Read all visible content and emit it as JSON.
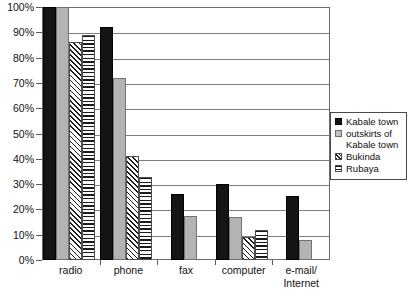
{
  "chart_data": {
    "type": "bar",
    "title": "",
    "xlabel": "",
    "ylabel": "",
    "ylim": [
      0,
      100
    ],
    "ytick_labels": [
      "0%",
      "10%",
      "20%",
      "30%",
      "40%",
      "50%",
      "60%",
      "70%",
      "80%",
      "90%",
      "100%"
    ],
    "ytick_values": [
      0,
      10,
      20,
      30,
      40,
      50,
      60,
      70,
      80,
      90,
      100
    ],
    "grid": true,
    "legend_position": "right",
    "categories": [
      "radio",
      "phone",
      "fax",
      "computer",
      "e-mail/\nInternet"
    ],
    "series": [
      {
        "name": "Kabale town",
        "pattern": "solid-black",
        "color": "#141414",
        "values": [
          100,
          92,
          26,
          30,
          25.5
        ]
      },
      {
        "name": "outskirts of\nKabale town",
        "pattern": "solid-gray",
        "color": "#b3b3b3",
        "values": [
          100,
          72,
          17.5,
          17,
          8
        ]
      },
      {
        "name": "Bukinda",
        "pattern": "diagonal-hatch",
        "color": "#ffffff",
        "values": [
          86,
          41,
          null,
          9,
          null
        ]
      },
      {
        "name": "Rubaya",
        "pattern": "horizontal-stripe",
        "color": "#ffffff",
        "values": [
          89,
          33,
          null,
          12,
          null
        ]
      }
    ]
  },
  "legend": {
    "items": [
      {
        "label": "Kabale town"
      },
      {
        "label": "outskirts of\nKabale town"
      },
      {
        "label": "Bukinda"
      },
      {
        "label": "Rubaya"
      }
    ]
  }
}
